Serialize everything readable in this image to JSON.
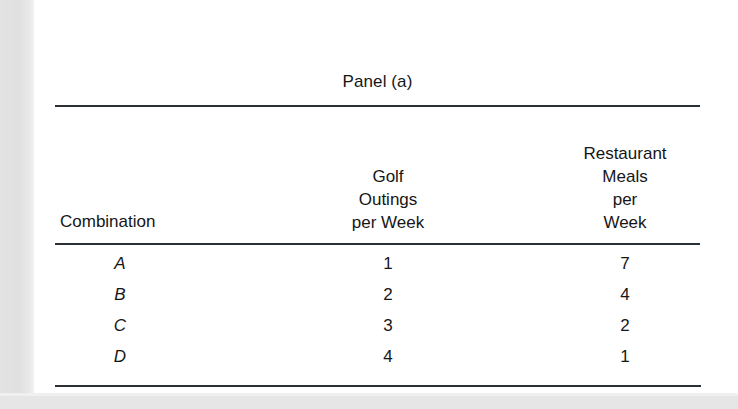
{
  "page": {
    "background_color": "#ffffff",
    "margin_color": "#e3e3e3",
    "rule_color": "#2b2f36",
    "text_color": "#161616"
  },
  "table": {
    "title": "Panel (a)",
    "headers": {
      "combination": "Combination",
      "golf": [
        "Golf",
        "Outings",
        "per Week"
      ],
      "restaurant": [
        "Restaurant",
        "Meals",
        "per",
        "Week"
      ]
    },
    "rows": [
      {
        "combination": "A",
        "golf": "1",
        "restaurant": "7"
      },
      {
        "combination": "B",
        "golf": "2",
        "restaurant": "4"
      },
      {
        "combination": "C",
        "golf": "3",
        "restaurant": "2"
      },
      {
        "combination": "D",
        "golf": "4",
        "restaurant": "1"
      }
    ]
  },
  "chart_data": {
    "type": "table",
    "title": "Panel (a)",
    "columns": [
      "Combination",
      "Golf Outings per Week",
      "Restaurant Meals per Week"
    ],
    "rows": [
      [
        "A",
        1,
        7
      ],
      [
        "B",
        2,
        4
      ],
      [
        "C",
        3,
        2
      ],
      [
        "D",
        4,
        1
      ]
    ],
    "series": [
      {
        "name": "Golf Outings per Week",
        "values": [
          1,
          2,
          3,
          4
        ]
      },
      {
        "name": "Restaurant Meals per Week",
        "values": [
          7,
          4,
          2,
          1
        ]
      }
    ],
    "categories": [
      "A",
      "B",
      "C",
      "D"
    ],
    "xlabel": "Combination",
    "ylabel": "",
    "grid": false,
    "legend": "none"
  }
}
